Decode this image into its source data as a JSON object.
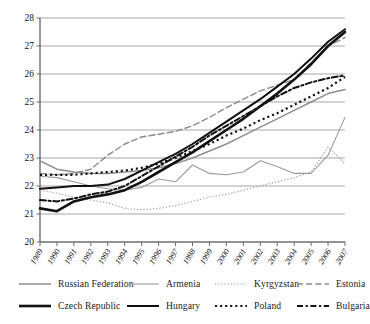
{
  "chart_data": {
    "type": "line",
    "title": "",
    "subtitle": "",
    "xlabel": "",
    "ylabel": "",
    "xlim": [
      1989,
      2007
    ],
    "ylim": [
      20,
      28
    ],
    "yticks": [
      20,
      21,
      22,
      23,
      24,
      25,
      26,
      27,
      28
    ],
    "grid": true,
    "legend_position": "bottom",
    "x": [
      1989,
      1990,
      1991,
      1992,
      1993,
      1994,
      1995,
      1996,
      1997,
      1998,
      1999,
      2000,
      2001,
      2002,
      2003,
      2004,
      2005,
      2006,
      2007
    ],
    "categories": [
      "1989",
      "1990",
      "1991",
      "1992",
      "1993",
      "1994",
      "1995",
      "1996",
      "1997",
      "1998",
      "1999",
      "2000",
      "2001",
      "2002",
      "2003",
      "2004",
      "2005",
      "2006",
      "2007"
    ],
    "series": [
      {
        "name": "Russian Federation",
        "style": "solid",
        "color": "#8d8d8d",
        "width": 1.5,
        "values": [
          22.9,
          22.6,
          22.5,
          22.45,
          22.45,
          22.5,
          22.55,
          22.65,
          22.8,
          23.0,
          23.25,
          23.5,
          23.8,
          24.1,
          24.4,
          24.7,
          25.0,
          25.3,
          25.45
        ]
      },
      {
        "name": "Armenia",
        "style": "solid",
        "color": "#9a9a9a",
        "width": 1.1,
        "values": [
          22.35,
          22.3,
          22.15,
          22.0,
          21.9,
          21.85,
          21.95,
          22.25,
          22.15,
          22.75,
          22.45,
          22.4,
          22.5,
          22.9,
          22.7,
          22.45,
          22.45,
          23.1,
          24.45
        ]
      },
      {
        "name": "Kyrgyzstan",
        "style": "dotted",
        "color": "#9a9a9a",
        "width": 1.2,
        "values": [
          21.85,
          21.75,
          21.6,
          21.5,
          21.4,
          21.2,
          21.15,
          21.2,
          21.3,
          21.45,
          21.6,
          21.7,
          21.85,
          22.0,
          22.15,
          22.3,
          22.5,
          23.4,
          22.8
        ]
      },
      {
        "name": "Estonia",
        "style": "dashed",
        "color": "#8a8a8a",
        "width": 1.4,
        "values": [
          22.45,
          22.4,
          22.45,
          22.6,
          23.1,
          23.5,
          23.75,
          23.85,
          23.95,
          24.15,
          24.45,
          24.8,
          25.1,
          25.4,
          25.6,
          25.8,
          26.4,
          27.0,
          27.3
        ]
      },
      {
        "name": "Czech Republic",
        "style": "solid",
        "color": "#111111",
        "width": 2.6,
        "values": [
          21.2,
          21.1,
          21.45,
          21.6,
          21.7,
          21.85,
          22.15,
          22.5,
          22.85,
          23.2,
          23.6,
          24.0,
          24.4,
          24.85,
          25.3,
          25.8,
          26.35,
          27.0,
          27.5
        ]
      },
      {
        "name": "Hungary",
        "style": "solid",
        "color": "#111111",
        "width": 2.0,
        "values": [
          21.9,
          21.95,
          22.0,
          22.0,
          22.05,
          22.25,
          22.55,
          22.85,
          23.15,
          23.5,
          23.9,
          24.3,
          24.7,
          25.1,
          25.55,
          26.0,
          26.55,
          27.15,
          27.6
        ]
      },
      {
        "name": "Poland",
        "style": "dotted",
        "color": "#111111",
        "width": 2.2,
        "values": [
          22.4,
          22.4,
          22.4,
          22.45,
          22.5,
          22.55,
          22.65,
          22.8,
          23.0,
          23.25,
          23.5,
          23.8,
          24.05,
          24.35,
          24.6,
          24.9,
          25.2,
          25.5,
          25.9
        ]
      },
      {
        "name": "Bulgaria",
        "style": "dashdot",
        "color": "#111111",
        "width": 2.0,
        "values": [
          21.5,
          21.45,
          21.55,
          21.7,
          21.8,
          22.0,
          22.35,
          22.7,
          23.05,
          23.4,
          23.8,
          24.15,
          24.5,
          24.85,
          25.2,
          25.5,
          25.7,
          25.85,
          25.95
        ]
      }
    ]
  },
  "legend": {
    "rows": [
      [
        {
          "label": "Russian Federation"
        },
        {
          "label": "Armenia"
        },
        {
          "label": "Kyrgyzstan"
        },
        {
          "label": "Estonia"
        }
      ],
      [
        {
          "label": "Czech Republic"
        },
        {
          "label": "Hungary"
        },
        {
          "label": "Poland"
        },
        {
          "label": "Bulgaria"
        }
      ]
    ]
  },
  "colors": {
    "grid": "#9b9b9b",
    "axis": "#6e6e6e",
    "dark_series": "#111111",
    "light_series": "#9a9a9a",
    "background": "#ffffff"
  }
}
